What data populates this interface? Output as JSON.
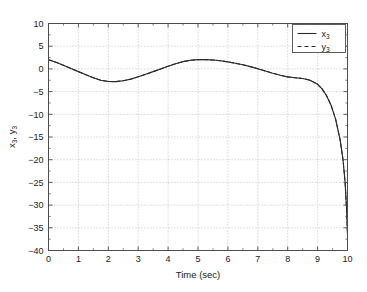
{
  "chart_data": {
    "type": "line",
    "title": "",
    "xlabel": "Time (sec)",
    "ylabel": "x3, y3",
    "ylabel_parts": {
      "first_base": "x",
      "first_sub": "3",
      "sep": ", ",
      "second_base": "y",
      "second_sub": "3"
    },
    "xlim": [
      0,
      10
    ],
    "ylim": [
      -40,
      10
    ],
    "xticks": [
      0,
      1,
      2,
      3,
      4,
      5,
      6,
      7,
      8,
      9,
      10
    ],
    "xtick_labels": [
      "0",
      "1",
      "2",
      "3",
      "4",
      "5",
      "6",
      "7",
      "8",
      "9",
      "10"
    ],
    "yticks": [
      10,
      5,
      0,
      -5,
      -10,
      -15,
      -20,
      -25,
      -30,
      -35,
      -40
    ],
    "ytick_labels": [
      "10",
      "5",
      "0",
      "-5",
      "-10",
      "-15",
      "-20",
      "-25",
      "-30",
      "-35",
      "-40"
    ],
    "grid": true,
    "grid_style": "dotted",
    "grid_color": "#b5b5b5",
    "axis_color": "#4d4d4d",
    "background": "#ffffff",
    "legend": {
      "position": "top-right",
      "entries": [
        {
          "label": "x3",
          "base": "x",
          "sub": "3",
          "style": "solid",
          "color": "#2b2b2b"
        },
        {
          "label": "y3",
          "base": "y",
          "sub": "3",
          "style": "dashed",
          "color": "#2b2b2b"
        }
      ]
    },
    "series": [
      {
        "name": "x3",
        "style": "solid",
        "color": "#2b2b2b",
        "x": [
          0,
          0.25,
          0.5,
          0.75,
          1,
          1.25,
          1.5,
          1.75,
          2,
          2.25,
          2.5,
          2.75,
          3,
          3.25,
          3.5,
          3.75,
          4,
          4.25,
          4.5,
          4.75,
          5,
          5.25,
          5.5,
          5.75,
          6,
          6.25,
          6.5,
          6.75,
          7,
          7.25,
          7.5,
          7.75,
          8,
          8.25,
          8.5,
          8.75,
          9,
          9.15,
          9.3,
          9.45,
          9.6,
          9.75,
          9.85,
          9.92,
          9.97,
          10
        ],
        "y": [
          2.0,
          1.45,
          0.8,
          0.1,
          -0.6,
          -1.3,
          -1.95,
          -2.5,
          -2.78,
          -2.8,
          -2.6,
          -2.25,
          -1.75,
          -1.2,
          -0.6,
          0.0,
          0.6,
          1.15,
          1.6,
          1.9,
          2.05,
          2.05,
          1.95,
          1.8,
          1.55,
          1.25,
          0.9,
          0.5,
          0.05,
          -0.45,
          -0.95,
          -1.4,
          -1.75,
          -1.95,
          -2.1,
          -2.5,
          -3.4,
          -4.4,
          -5.9,
          -8.0,
          -11.0,
          -15.5,
          -20.0,
          -25.0,
          -31.0,
          -36.5
        ]
      },
      {
        "name": "y3",
        "style": "dashed",
        "color": "#2b2b2b",
        "x": [
          0,
          0.25,
          0.5,
          0.75,
          1,
          1.25,
          1.5,
          1.75,
          2,
          2.25,
          2.5,
          2.75,
          3,
          3.25,
          3.5,
          3.75,
          4,
          4.25,
          4.5,
          4.75,
          5,
          5.25,
          5.5,
          5.75,
          6,
          6.25,
          6.5,
          6.75,
          7,
          7.25,
          7.5,
          7.75,
          8,
          8.25,
          8.5,
          8.75,
          9,
          9.15,
          9.3,
          9.45,
          9.6,
          9.75,
          9.85,
          9.92,
          9.97,
          10
        ],
        "y": [
          2.0,
          1.45,
          0.8,
          0.1,
          -0.6,
          -1.3,
          -1.95,
          -2.5,
          -2.78,
          -2.8,
          -2.6,
          -2.25,
          -1.75,
          -1.2,
          -0.6,
          0.0,
          0.6,
          1.15,
          1.6,
          1.9,
          2.05,
          2.05,
          1.95,
          1.8,
          1.55,
          1.25,
          0.9,
          0.5,
          0.05,
          -0.45,
          -0.95,
          -1.4,
          -1.75,
          -1.95,
          -2.1,
          -2.5,
          -3.4,
          -4.4,
          -5.9,
          -8.0,
          -11.0,
          -15.5,
          -20.0,
          -25.0,
          -31.0,
          -36.5
        ]
      }
    ]
  }
}
